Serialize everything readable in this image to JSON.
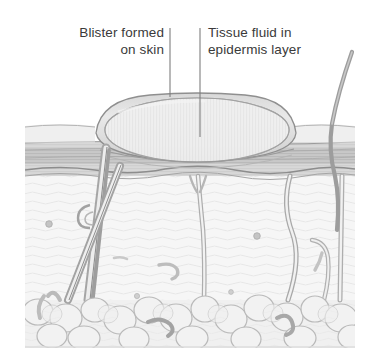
{
  "figure": {
    "type": "medical-illustration",
    "background_color": "#ffffff"
  },
  "labels": [
    {
      "id": "blister-formed-on-skin",
      "text": "Blister formed\non skin",
      "line1": "Blister formed",
      "line2": "on skin",
      "align": "right",
      "leader_line": {
        "x": 170,
        "y_start": 28,
        "y_end": 97
      }
    },
    {
      "id": "tissue-fluid-in-epidermis-layer",
      "text": "Tissue fluid in\nepidermis layer",
      "line1": "Tissue fluid in",
      "line2": "epidermis layer",
      "align": "left",
      "leader_line": {
        "x": 200,
        "y_start": 28,
        "y_end": 137
      }
    }
  ],
  "colors": {
    "text": "#3a3a3a",
    "leader_line": "#7a7a7a",
    "outline": "#8d8d8d",
    "outline_dark": "#6f6f6f",
    "epidermis_fill": "#c2c2c2",
    "epidermis_fill_light": "#d4d4d4",
    "dermis_fill": "#f4f4f4",
    "fat_fill": "#ededed",
    "blister_fluid": "#eeeeee",
    "blister_membrane": "#c9c9c9",
    "hair": "#9a9a9a",
    "background": "#ffffff"
  },
  "anatomy": {
    "regions": [
      {
        "name": "blister-dome",
        "description": "Elongated fluid-filled dome raised above skin surface"
      },
      {
        "name": "blister-fluid",
        "description": "Tissue fluid collected within the epidermis layer"
      },
      {
        "name": "epidermis",
        "description": "Upper striated skin layer band"
      },
      {
        "name": "dermis",
        "description": "Wavy fibrous middle layer containing follicles, glands and cells"
      },
      {
        "name": "subcutaneous-fat",
        "description": "Rounded lobules of fat at the base"
      },
      {
        "name": "hair-follicle",
        "description": "Diagonal follicle with hair shaft on the left"
      },
      {
        "name": "sweat-gland-duct",
        "description": "Slender duct ascending from the dermis"
      },
      {
        "name": "hair-shaft-right",
        "description": "Hair strand emerging and curving above the skin on the right"
      }
    ]
  }
}
